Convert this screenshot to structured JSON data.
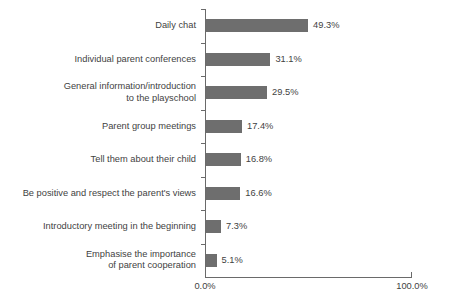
{
  "chart_data": {
    "type": "bar",
    "orientation": "horizontal",
    "title": "",
    "subtitle": "",
    "xlabel": "",
    "ylabel": "",
    "xlim": [
      0,
      100
    ],
    "grid": false,
    "legend": null,
    "categories": [
      "Daily chat",
      "Individual parent conferences",
      "General information/introduction\nto the playschool",
      "Parent group meetings",
      "Tell them about their child",
      "Be positive and respect the parent's views",
      "Introductory meeting in the beginning",
      "Emphasise the importance\nof parent cooperation"
    ],
    "values": [
      49.3,
      31.1,
      29.5,
      17.4,
      16.8,
      16.6,
      7.3,
      5.1
    ],
    "value_labels": [
      "49.3%",
      "31.1%",
      "29.5%",
      "17.4%",
      "16.8%",
      "16.6%",
      "7.3%",
      "5.1%"
    ],
    "xtick_labels": [
      "0.0%",
      "100.0%"
    ],
    "xtick_values": [
      0,
      100
    ],
    "bar_color": "#6e6e6e",
    "axis_color": "#6a6a6a",
    "text_color": "#3f3f3f",
    "background_color": "#ffffff"
  }
}
